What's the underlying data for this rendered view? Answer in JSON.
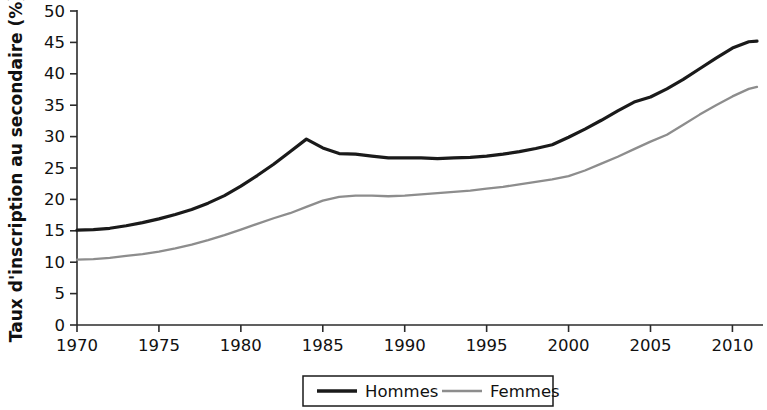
{
  "chart_data": {
    "type": "line",
    "title": "",
    "xlabel": "",
    "ylabel": "Taux d'inscription au secondaire (%)",
    "xlim": [
      1970,
      2011.5
    ],
    "ylim": [
      0,
      50
    ],
    "grid": false,
    "legend_position": "bottom-center",
    "x_ticks": [
      "1970",
      "1975",
      "1980",
      "1985",
      "1990",
      "1995",
      "2000",
      "2005",
      "2010"
    ],
    "x_tick_values": [
      1970,
      1975,
      1980,
      1985,
      1990,
      1995,
      2000,
      2005,
      2010
    ],
    "y_ticks": [
      "0",
      "5",
      "10",
      "15",
      "20",
      "25",
      "30",
      "35",
      "40",
      "45",
      "50"
    ],
    "y_tick_values": [
      0,
      5,
      10,
      15,
      20,
      25,
      30,
      35,
      40,
      45,
      50
    ],
    "x": [
      1970,
      1971,
      1972,
      1973,
      1974,
      1975,
      1976,
      1977,
      1978,
      1979,
      1980,
      1981,
      1982,
      1983,
      1984,
      1985,
      1986,
      1987,
      1988,
      1989,
      1990,
      1991,
      1992,
      1993,
      1994,
      1995,
      1996,
      1997,
      1998,
      1999,
      2000,
      2001,
      2002,
      2003,
      2004,
      2005,
      2006,
      2007,
      2008,
      2009,
      2010,
      2011,
      2011.5
    ],
    "series": [
      {
        "name": "Hommes",
        "color": "#1a1a1a",
        "width": 3.2,
        "values": [
          15.1,
          15.2,
          15.4,
          15.8,
          16.3,
          16.9,
          17.6,
          18.4,
          19.4,
          20.6,
          22.1,
          23.8,
          25.6,
          27.6,
          29.6,
          28.2,
          27.3,
          27.2,
          26.9,
          26.6,
          26.6,
          26.6,
          26.5,
          26.6,
          26.7,
          26.9,
          27.2,
          27.6,
          28.1,
          28.7,
          29.9,
          31.2,
          32.6,
          34.1,
          35.5,
          36.3,
          37.6,
          39.1,
          40.8,
          42.5,
          44.1,
          45.1,
          45.2
        ]
      },
      {
        "name": "Femmes",
        "color": "#8d8d8d",
        "width": 2.3,
        "values": [
          10.4,
          10.5,
          10.7,
          11.0,
          11.3,
          11.7,
          12.2,
          12.8,
          13.5,
          14.3,
          15.2,
          16.1,
          17.0,
          17.8,
          18.8,
          19.8,
          20.4,
          20.6,
          20.6,
          20.5,
          20.6,
          20.8,
          21.0,
          21.2,
          21.4,
          21.7,
          22.0,
          22.4,
          22.8,
          23.2,
          23.7,
          24.6,
          25.7,
          26.8,
          28.0,
          29.2,
          30.3,
          31.9,
          33.5,
          35.0,
          36.4,
          37.6,
          37.9
        ]
      }
    ],
    "legend": [
      {
        "label": "Hommes",
        "color": "#1a1a1a",
        "width": 3.4
      },
      {
        "label": "Femmes",
        "color": "#8d8d8d",
        "width": 2.4
      }
    ]
  }
}
